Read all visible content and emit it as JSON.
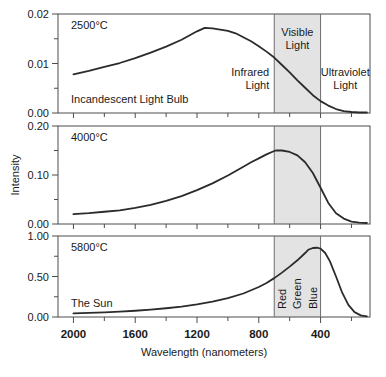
{
  "figure": {
    "background": "#ffffff",
    "axis_color": "#4d4d4d",
    "curve_color": "#2b2b2b",
    "band_fill": "#e3e3e3",
    "band_stroke": "#6e6e6e"
  },
  "axes": {
    "xlabel": "Wavelength (nanometers)",
    "ylabel": "Intensity",
    "x_ticks_major": [
      2000,
      1600,
      1200,
      800,
      400
    ],
    "x_tick_labels": [
      "2000",
      "1600",
      "1200",
      "800",
      "400"
    ],
    "x_ticks_minor": [
      1800,
      1400,
      1000,
      600,
      200
    ],
    "x_range": [
      2100,
      80
    ],
    "x_direction": "decreasing"
  },
  "bands": {
    "infrared": {
      "label_line1": "Infrared",
      "label_line2": "Light"
    },
    "visible": {
      "label_line1": "Visible",
      "label_line2": "Light",
      "start_nm": 700,
      "end_nm": 400
    },
    "ultraviolet": {
      "label_line1": "Ultraviolet",
      "label_line2": "Light"
    },
    "color_labels": [
      "Red",
      "Green",
      "Blue"
    ]
  },
  "chart_data": {
    "type": "line",
    "title": "",
    "xlabel": "Wavelength (nanometers)",
    "ylabel": "Intensity",
    "xlim": [
      2100,
      80
    ],
    "x_tick_labels": [
      "2000",
      "1600",
      "1200",
      "800",
      "400"
    ],
    "grid": false,
    "legend": "none",
    "annotations": [
      "Infrared Light",
      "Visible Light",
      "Ultraviolet Light",
      "Red",
      "Green",
      "Blue"
    ],
    "shaded_region": {
      "name": "Visible Light",
      "x_start_nm": 700,
      "x_end_nm": 400,
      "fill": "#e3e3e3"
    },
    "panels": [
      {
        "name": "2500C",
        "temperature_label": "2500°C",
        "source_label": "Incandescent Light Bulb",
        "ylim": [
          0.0,
          0.02
        ],
        "y_tick_labels": [
          "0.00",
          "0.01",
          "0.02"
        ],
        "y_ticks": [
          0.0,
          0.01,
          0.02
        ],
        "y_minor_ticks": [
          0.005,
          0.015
        ],
        "peak_nm": 1150,
        "peak_value": 0.0172,
        "x": [
          2000,
          1900,
          1800,
          1700,
          1600,
          1500,
          1400,
          1300,
          1200,
          1150,
          1100,
          1000,
          950,
          900,
          850,
          800,
          750,
          700,
          650,
          600,
          550,
          500,
          450,
          400,
          350,
          300,
          250,
          200,
          150,
          100
        ],
        "y": [
          0.0078,
          0.0085,
          0.0093,
          0.0101,
          0.0111,
          0.0122,
          0.0134,
          0.0148,
          0.0165,
          0.0172,
          0.0171,
          0.0166,
          0.0161,
          0.0153,
          0.0145,
          0.0135,
          0.0124,
          0.0112,
          0.0097,
          0.0082,
          0.0066,
          0.0051,
          0.0036,
          0.0024,
          0.0015,
          0.0008,
          0.0004,
          0.0002,
          0.0001,
          0.0001
        ]
      },
      {
        "name": "4000C",
        "temperature_label": "4000°C",
        "source_label": "",
        "ylim": [
          0.0,
          0.2
        ],
        "y_tick_labels": [
          "0.00",
          "0.10",
          "0.20"
        ],
        "y_ticks": [
          0.0,
          0.1,
          0.2
        ],
        "y_minor_ticks": [
          0.05,
          0.15
        ],
        "peak_nm": 690,
        "peak_value": 0.15,
        "x": [
          2000,
          1900,
          1800,
          1700,
          1600,
          1500,
          1400,
          1300,
          1200,
          1100,
          1000,
          900,
          850,
          800,
          750,
          700,
          690,
          650,
          600,
          550,
          500,
          450,
          400,
          350,
          300,
          250,
          200,
          150,
          100
        ],
        "y": [
          0.02,
          0.022,
          0.025,
          0.028,
          0.033,
          0.039,
          0.047,
          0.057,
          0.069,
          0.083,
          0.099,
          0.117,
          0.126,
          0.134,
          0.142,
          0.149,
          0.15,
          0.15,
          0.147,
          0.14,
          0.126,
          0.104,
          0.074,
          0.043,
          0.022,
          0.011,
          0.005,
          0.003,
          0.002
        ]
      },
      {
        "name": "5800C",
        "temperature_label": "5800°C",
        "source_label": "The Sun",
        "ylim": [
          0.0,
          1.0
        ],
        "y_tick_labels": [
          "0.00",
          "0.50",
          "1.00"
        ],
        "y_ticks": [
          0.0,
          0.5,
          1.0
        ],
        "y_minor_ticks": [
          0.25,
          0.75
        ],
        "peak_nm": 480,
        "peak_value": 0.855,
        "x": [
          2000,
          1900,
          1800,
          1700,
          1600,
          1500,
          1400,
          1300,
          1200,
          1100,
          1000,
          900,
          800,
          750,
          700,
          650,
          600,
          550,
          500,
          480,
          450,
          420,
          400,
          370,
          340,
          300,
          260,
          220,
          180,
          140,
          100
        ],
        "y": [
          0.045,
          0.05,
          0.057,
          0.066,
          0.077,
          0.091,
          0.108,
          0.129,
          0.156,
          0.19,
          0.233,
          0.29,
          0.37,
          0.42,
          0.48,
          0.548,
          0.622,
          0.7,
          0.79,
          0.83,
          0.852,
          0.855,
          0.845,
          0.79,
          0.69,
          0.5,
          0.3,
          0.15,
          0.06,
          0.02,
          0.008
        ]
      }
    ]
  }
}
